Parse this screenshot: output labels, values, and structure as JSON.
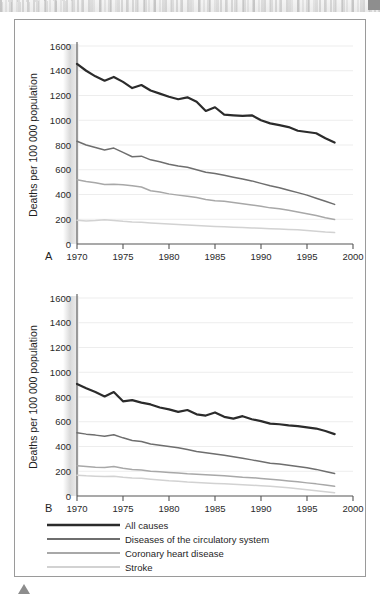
{
  "figure": {
    "panels": [
      {
        "id": "A",
        "panel_label": "A",
        "ylabel": "Deaths per 100 000 population"
      },
      {
        "id": "B",
        "panel_label": "B",
        "ylabel": "Deaths per 100 000 population"
      }
    ],
    "legend": {
      "items": [
        {
          "label": "All causes",
          "color": "#2b2b2b",
          "width": 2.4
        },
        {
          "label": "Diseases of the circulatory system",
          "color": "#6e6e6e",
          "width": 1.8
        },
        {
          "label": "Coronary heart disease",
          "color": "#a8a8a8",
          "width": 1.8
        },
        {
          "label": "Stroke",
          "color": "#d2d2d2",
          "width": 1.8
        }
      ]
    }
  },
  "chart_data": [
    {
      "type": "line",
      "id": "A",
      "title": "",
      "panel_label": "A",
      "xlabel": "",
      "ylabel": "Deaths per 100 000 population",
      "xlim": [
        1970,
        2000
      ],
      "ylim": [
        0,
        1600
      ],
      "xticks": [
        1970,
        1975,
        1980,
        1985,
        1990,
        1995,
        2000
      ],
      "yticks": [
        0,
        200,
        400,
        600,
        800,
        1000,
        1200,
        1400,
        1600
      ],
      "grid": "horizontal",
      "legend_position": "below-figure",
      "x": [
        1970,
        1971,
        1972,
        1973,
        1974,
        1975,
        1976,
        1977,
        1978,
        1979,
        1980,
        1981,
        1982,
        1983,
        1984,
        1985,
        1986,
        1987,
        1988,
        1989,
        1990,
        1991,
        1992,
        1993,
        1994,
        1995,
        1996,
        1997,
        1998
      ],
      "series": [
        {
          "name": "All causes",
          "color": "#2b2b2b",
          "values": [
            1455,
            1400,
            1355,
            1320,
            1350,
            1310,
            1260,
            1285,
            1240,
            1215,
            1190,
            1170,
            1185,
            1150,
            1075,
            1105,
            1045,
            1040,
            1035,
            1040,
            1000,
            975,
            960,
            945,
            915,
            905,
            895,
            855,
            820
          ]
        },
        {
          "name": "Diseases of the circulatory system",
          "color": "#6e6e6e",
          "values": [
            830,
            800,
            780,
            760,
            775,
            740,
            705,
            710,
            680,
            665,
            645,
            630,
            620,
            600,
            580,
            570,
            555,
            540,
            525,
            510,
            490,
            470,
            455,
            435,
            415,
            395,
            370,
            345,
            320
          ]
        },
        {
          "name": "Coronary heart disease",
          "color": "#a8a8a8",
          "values": [
            520,
            505,
            495,
            480,
            482,
            478,
            470,
            460,
            430,
            420,
            405,
            395,
            385,
            375,
            360,
            350,
            345,
            335,
            325,
            315,
            305,
            292,
            285,
            272,
            258,
            245,
            230,
            212,
            198
          ]
        },
        {
          "name": "Stroke",
          "color": "#d2d2d2",
          "values": [
            192,
            186,
            190,
            196,
            190,
            183,
            178,
            175,
            170,
            166,
            162,
            158,
            154,
            150,
            146,
            142,
            139,
            136,
            133,
            130,
            127,
            124,
            121,
            118,
            115,
            110,
            104,
            96,
            92
          ]
        }
      ]
    },
    {
      "type": "line",
      "id": "B",
      "title": "",
      "panel_label": "B",
      "xlabel": "",
      "ylabel": "Deaths per 100 000 population",
      "xlim": [
        1970,
        2000
      ],
      "ylim": [
        0,
        1600
      ],
      "xticks": [
        1970,
        1975,
        1980,
        1985,
        1990,
        1995,
        2000
      ],
      "yticks": [
        0,
        200,
        400,
        600,
        800,
        1000,
        1200,
        1400,
        1600
      ],
      "grid": "horizontal",
      "legend_position": "below-figure",
      "x": [
        1970,
        1971,
        1972,
        1973,
        1974,
        1975,
        1976,
        1977,
        1978,
        1979,
        1980,
        1981,
        1982,
        1983,
        1984,
        1985,
        1986,
        1987,
        1988,
        1989,
        1990,
        1991,
        1992,
        1993,
        1994,
        1995,
        1996,
        1997,
        1998
      ],
      "series": [
        {
          "name": "All causes",
          "color": "#2b2b2b",
          "values": [
            905,
            870,
            840,
            805,
            840,
            765,
            775,
            755,
            740,
            715,
            700,
            680,
            695,
            660,
            650,
            675,
            640,
            625,
            645,
            620,
            605,
            585,
            580,
            570,
            565,
            555,
            545,
            525,
            500
          ]
        },
        {
          "name": "Diseases of the circulatory system",
          "color": "#6e6e6e",
          "values": [
            512,
            500,
            492,
            482,
            495,
            470,
            448,
            440,
            420,
            410,
            400,
            390,
            375,
            360,
            350,
            340,
            330,
            318,
            305,
            292,
            278,
            265,
            258,
            248,
            238,
            228,
            215,
            198,
            182
          ]
        },
        {
          "name": "Coronary heart disease",
          "color": "#a8a8a8",
          "values": [
            245,
            238,
            232,
            230,
            238,
            225,
            215,
            210,
            200,
            195,
            190,
            186,
            180,
            176,
            172,
            168,
            164,
            158,
            152,
            148,
            142,
            136,
            130,
            122,
            115,
            106,
            98,
            88,
            78
          ]
        },
        {
          "name": "Stroke",
          "color": "#d2d2d2",
          "values": [
            168,
            163,
            160,
            158,
            160,
            152,
            146,
            143,
            136,
            130,
            124,
            120,
            114,
            110,
            106,
            102,
            99,
            95,
            91,
            87,
            83,
            78,
            72,
            66,
            58,
            50,
            42,
            34,
            26
          ]
        }
      ]
    }
  ]
}
